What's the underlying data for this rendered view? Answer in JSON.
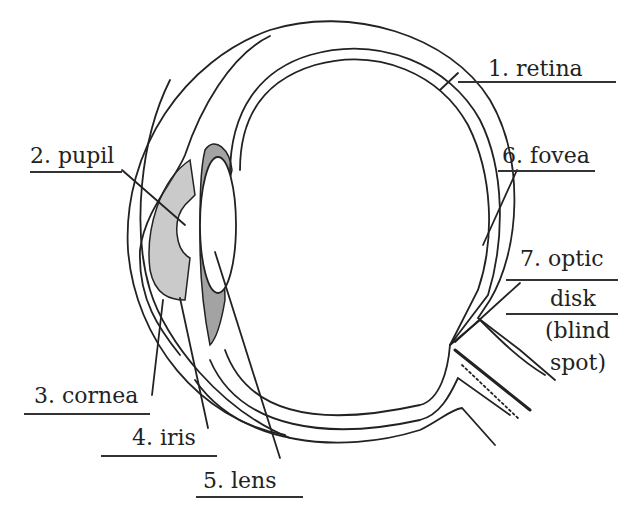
{
  "diagram": {
    "labels": [
      {
        "id": "retina",
        "number": "1.",
        "text": "1. retina"
      },
      {
        "id": "pupil",
        "number": "2.",
        "text": "2. pupil"
      },
      {
        "id": "cornea",
        "number": "3.",
        "text": "3. cornea"
      },
      {
        "id": "iris",
        "number": "4.",
        "text": "4. iris"
      },
      {
        "id": "lens",
        "number": "5.",
        "text": "5. lens"
      },
      {
        "id": "fovea",
        "number": "6.",
        "text": "6. fovea"
      },
      {
        "id": "optic-disk",
        "number": "7.",
        "text_line1": "7. optic",
        "text_line2": "disk",
        "text_line3": "(blind",
        "text_line4": "spot)"
      }
    ],
    "colors": {
      "ink": "#222222",
      "background": "#ffffff"
    }
  }
}
